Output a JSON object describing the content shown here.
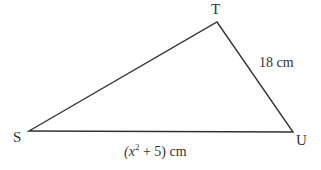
{
  "diagram": {
    "type": "triangle",
    "vertices": [
      {
        "id": "S",
        "label": "S",
        "x": 29,
        "y": 131
      },
      {
        "id": "T",
        "label": "T",
        "x": 217,
        "y": 22
      },
      {
        "id": "U",
        "label": "U",
        "x": 293,
        "y": 132
      }
    ],
    "sides": [
      {
        "from": "T",
        "to": "U",
        "label": "18 cm"
      },
      {
        "from": "S",
        "to": "U",
        "label_prefix": "(x",
        "label_exp": "2",
        "label_suffix": " + 5) cm"
      }
    ],
    "colors": {
      "line": "#333333",
      "text": "#333333",
      "background": "#ffffff"
    }
  }
}
